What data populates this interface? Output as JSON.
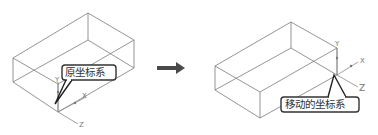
{
  "left_panel": {
    "callout_label": "原坐标系",
    "axes": {
      "y": "Y",
      "x": "X",
      "z": "Z"
    }
  },
  "arrow": {
    "direction": "right",
    "color": "#4a4a4a"
  },
  "right_panel": {
    "callout_label": "移动的坐标系",
    "axes": {
      "y": "Y",
      "x": "X",
      "z": "Z"
    }
  }
}
